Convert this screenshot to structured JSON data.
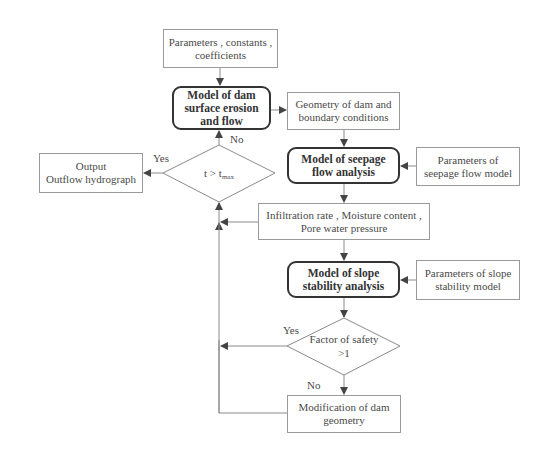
{
  "diagram": {
    "nodes": {
      "params_constants": {
        "text": "Parameters , constants , coefficients"
      },
      "erosion_model": {
        "text": "Model of dam surface erosion and flow"
      },
      "geometry": {
        "text": "Geometry of dam and boundary conditions"
      },
      "time_check": {
        "text": "t > t",
        "subscript": "max"
      },
      "output": {
        "line1": "Output",
        "line2": "Outflow hydrograph"
      },
      "seepage_model": {
        "text": "Model of seepage flow analysis"
      },
      "seepage_params": {
        "text": "Parameters of seepage flow model"
      },
      "infiltration": {
        "text": "Infiltration rate , Moisture content , Pore water pressure"
      },
      "slope_model": {
        "text": "Model of slope stability analysis"
      },
      "slope_params": {
        "text": "Parameters of slope stability model"
      },
      "safety_check": {
        "line1": "Factor of safety",
        "line2": ">1"
      },
      "modification": {
        "text": "Modification of dam geometry"
      }
    },
    "edge_labels": {
      "time_yes": "Yes",
      "time_no": "No",
      "safety_yes": "Yes",
      "safety_no": "No"
    },
    "colors": {
      "line": "#8a8a8a",
      "arrow": "#444444",
      "model_border": "#333333",
      "box_border": "#9a9a9a"
    }
  }
}
